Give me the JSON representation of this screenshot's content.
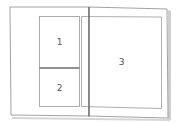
{
  "diagram": {
    "type": "page-layout",
    "regions": [
      {
        "id": "region-1",
        "label": "1",
        "page": "left",
        "position": "top"
      },
      {
        "id": "region-2",
        "label": "2",
        "page": "left",
        "position": "bottom"
      },
      {
        "id": "region-3",
        "label": "3",
        "page": "right",
        "position": "full"
      }
    ],
    "colors": {
      "stroke": "#777777",
      "spine": "#555555",
      "shadow": "#c8c8c8",
      "background": "#ffffff",
      "label": "#555555"
    }
  }
}
